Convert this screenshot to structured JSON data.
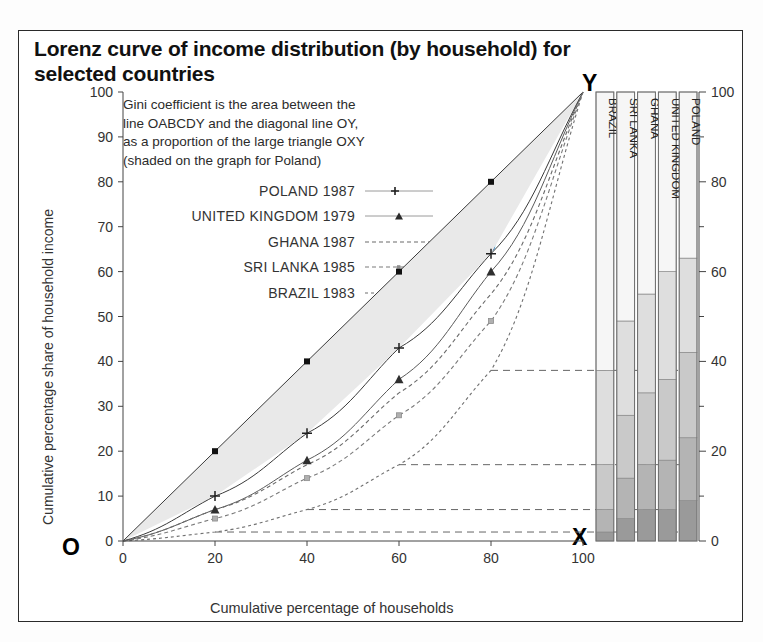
{
  "title": "Lorenz curve of income distribution (by household) for selected countries",
  "note_lines": [
    "Gini coefficient is the area between the",
    "line OABCDY and the diagonal line OY,",
    "as a proportion of the large triangle OXY",
    "(shaded on the graph for Poland)"
  ],
  "corner_labels": {
    "origin": "O",
    "top_right": "Y",
    "bottom_right": "X"
  },
  "curve_point_labels": [
    "A",
    "B",
    "C",
    "D"
  ],
  "colors": {
    "frame": "#2a2a2a",
    "axis": "#444444",
    "shade": "#e9e9e9",
    "poland_line": "#3a3a3a",
    "uk_line": "#5a5a5a",
    "ghana_line": "#6a6a6a",
    "srilanka_line": "#7a7a7a",
    "brazil_line": "#6f6f6f",
    "leader": "#666666",
    "seg1": "#9a9a9a",
    "seg2": "#b4b4b4",
    "seg3": "#c9c9c9",
    "seg4": "#dedede",
    "seg5": "#f6f6f6"
  },
  "chart_data": {
    "type": "line",
    "title": "Lorenz curve of income distribution (by household) for selected countries",
    "xlabel": "Cumulative percentage of households",
    "ylabel": "Cumulative percentage share of household income",
    "xlim": [
      0,
      100
    ],
    "ylim": [
      0,
      100
    ],
    "xticks": [
      0,
      20,
      40,
      60,
      80,
      100
    ],
    "yticks": [
      0,
      10,
      20,
      30,
      40,
      50,
      60,
      70,
      80,
      90,
      100
    ],
    "grid": false,
    "legend_position": "upper-left-inside",
    "x": [
      0,
      20,
      40,
      60,
      80,
      100
    ],
    "series": [
      {
        "name": "POLAND 1987",
        "marker": "plus",
        "style": "solid-thin",
        "values": [
          0,
          10,
          24,
          43,
          64,
          100
        ]
      },
      {
        "name": "UNITED KINGDOM 1979",
        "marker": "triangle",
        "style": "solid-thin",
        "values": [
          0,
          7,
          18,
          36,
          60,
          100
        ]
      },
      {
        "name": "GHANA 1987",
        "marker": "none",
        "style": "dashed",
        "values": [
          0,
          7,
          17,
          33,
          55,
          100
        ]
      },
      {
        "name": "SRI LANKA 1985",
        "marker": "none",
        "style": "dashed",
        "values": [
          0,
          5,
          14,
          28,
          49,
          100
        ]
      },
      {
        "name": "BRAZIL 1983",
        "marker": "none",
        "style": "dashed",
        "values": [
          0,
          2,
          7,
          17,
          38,
          100
        ]
      }
    ],
    "diagonal_line": {
      "name": "line of perfect equality OY",
      "from": [
        0,
        0
      ],
      "to": [
        100,
        100
      ]
    },
    "annotated_points": [
      {
        "label": "A",
        "x": 20,
        "y": 10
      },
      {
        "label": "B",
        "x": 40,
        "y": 24
      },
      {
        "label": "C",
        "x": 60,
        "y": 43
      },
      {
        "label": "D",
        "x": 80,
        "y": 64
      }
    ],
    "shaded_region": "Gini area for Poland between OABCDY and diagonal OY"
  },
  "bar_panel": {
    "axis_title": "",
    "ticks": [
      0,
      20,
      40,
      60,
      80,
      100
    ],
    "minor_ticks": [
      10,
      30,
      50,
      70,
      90
    ],
    "bars": [
      {
        "label": "BRAZIL",
        "segments": [
          2,
          5,
          10,
          21,
          62
        ]
      },
      {
        "label": "SRI LANKA",
        "segments": [
          5,
          9,
          14,
          21,
          51
        ]
      },
      {
        "label": "GHANA",
        "segments": [
          7,
          10,
          16,
          22,
          45
        ]
      },
      {
        "label": "UNITED KINGDOM",
        "segments": [
          7,
          11,
          18,
          24,
          40
        ]
      },
      {
        "label": "POLAND",
        "segments": [
          9,
          14,
          19,
          21,
          37
        ]
      }
    ]
  }
}
